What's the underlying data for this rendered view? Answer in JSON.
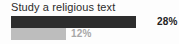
{
  "chart_data": {
    "type": "bar",
    "title": "Study a religious text",
    "orientation": "horizontal",
    "xlabel": "",
    "ylabel": "",
    "grid": false,
    "legend": "none",
    "xlim": [
      0,
      100
    ],
    "categories": [
      "series-1",
      "series-2"
    ],
    "values": [
      28,
      12
    ],
    "value_labels": [
      "28%",
      "12%"
    ],
    "series": [
      {
        "name": "series-1",
        "value": 28,
        "label": "28%",
        "color": "#2d2d2d",
        "label_color": "#222222",
        "bar_width_px": 125,
        "label_left_px": 146
      },
      {
        "name": "series-2",
        "value": 12,
        "label": "12%",
        "color": "#bdbdbd",
        "label_color": "#a8a8a8",
        "bar_width_px": 55,
        "label_left_px": 60
      }
    ],
    "colors": {
      "background": "#fdfdfd",
      "title": "#2b2b2b",
      "bar_dark": "#2d2d2d",
      "bar_light": "#bdbdbd"
    }
  }
}
